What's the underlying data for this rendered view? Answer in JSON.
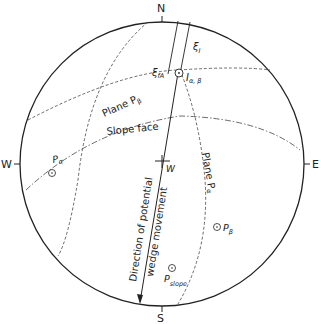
{
  "compass": {
    "north": "N",
    "south": "S",
    "east": "E",
    "west": "W"
  },
  "planes": {
    "plane_beta": "Plane P",
    "plane_beta_sub": "β",
    "plane_alpha": "Plane P",
    "plane_alpha_sub": "α",
    "slope_face": "Slope face"
  },
  "poles": {
    "p_alpha": "P",
    "p_alpha_sub": "α",
    "p_beta": "P",
    "p_beta_sub": "β",
    "p_slope": "P",
    "p_slope_sub": "slope"
  },
  "symbols": {
    "xi_I": "ξ",
    "xi_I_sub": "I",
    "xi_fA": "ξ",
    "xi_fA_sub": "fA",
    "intersection": "I",
    "intersection_sub": "α, β",
    "w_label": "W"
  },
  "annotations": {
    "direction_line1": "Direction of potential",
    "direction_line2": "wedge movement"
  },
  "colors": {
    "ink": "#222222",
    "background": "#ffffff"
  }
}
